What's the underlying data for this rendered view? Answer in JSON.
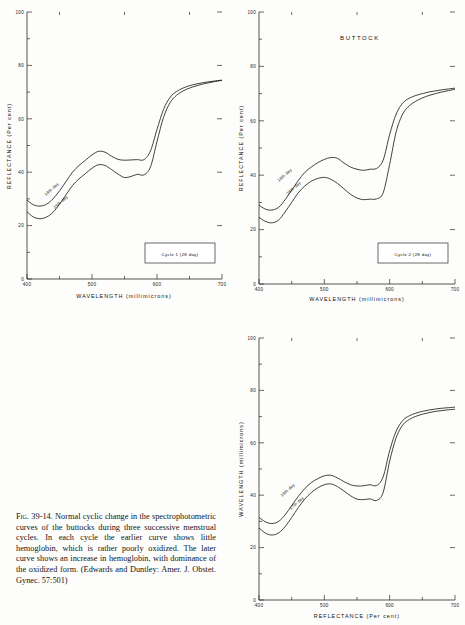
{
  "figure": {
    "caption_prefix": "Fig. 39-14.",
    "caption_body": "Normal cyclic change in the spectrophotometric curves of the buttocks during three successive menstrual cycles. In each cycle the earlier curve shows little hemoglobin, which is rather poorly oxidized. The later curve shows an increase in hemoglobin, with dominance of the oxidized form. (Edwards and Duntley: Amer. J. Obstet. Gynec. 57:501)"
  },
  "chart_data": [
    {
      "type": "line",
      "panel_id": "cycle-1",
      "title": "",
      "legend": "Cycle 1  (28 day)",
      "legend_position": "bottom-right",
      "xlabel": "WAVELENGTH  (millimicrons)",
      "ylabel": "REFLECTANCE  (Per cent)",
      "xlim": [
        400,
        700
      ],
      "ylim": [
        0,
        100
      ],
      "xticks": [
        400,
        500,
        600,
        700
      ],
      "xticklabels": [
        "400",
        "500",
        "600",
        "700"
      ],
      "yticks": [
        0,
        20,
        40,
        60,
        80,
        100
      ],
      "yticklabels": [
        "0",
        "20",
        "40",
        "60",
        "80",
        "100"
      ],
      "minor_xticks": [
        450,
        550,
        650
      ],
      "minor_yticks": [
        10,
        30,
        50,
        70,
        90
      ],
      "grid": false,
      "x": [
        400,
        410,
        420,
        430,
        440,
        450,
        460,
        470,
        480,
        490,
        500,
        510,
        520,
        530,
        540,
        550,
        560,
        570,
        580,
        590,
        600,
        610,
        620,
        630,
        640,
        650,
        660,
        670,
        680,
        690,
        700
      ],
      "series": [
        {
          "name": "18th day",
          "label": "18th day",
          "values": [
            29.5,
            27.8,
            27.3,
            28.0,
            30.0,
            33.0,
            36.5,
            40.0,
            42.5,
            44.5,
            46.5,
            47.8,
            47.5,
            46.0,
            44.8,
            44.5,
            44.6,
            44.7,
            44.7,
            48.0,
            56.0,
            63.5,
            68.0,
            70.2,
            71.5,
            72.4,
            73.0,
            73.5,
            73.9,
            74.2,
            74.5
          ]
        },
        {
          "name": "25th day",
          "label": "25th day",
          "values": [
            25.2,
            23.2,
            22.6,
            23.2,
            25.0,
            28.0,
            31.5,
            35.0,
            37.5,
            39.5,
            41.5,
            42.8,
            42.5,
            41.0,
            39.3,
            38.0,
            38.4,
            39.2,
            39.0,
            42.0,
            51.5,
            60.5,
            66.0,
            68.8,
            70.4,
            71.5,
            72.3,
            73.0,
            73.5,
            74.0,
            74.4
          ]
        }
      ]
    },
    {
      "type": "line",
      "panel_id": "cycle-2",
      "title": "BUTTOCK",
      "legend": "Cycle 2  (28 day)",
      "legend_position": "bottom-right",
      "xlabel": "WAVELENGTH  (millimicrons)",
      "ylabel": "REFLECTANCE  (Per cent)",
      "xlim": [
        400,
        700
      ],
      "ylim": [
        0,
        100
      ],
      "xticks": [
        400,
        500,
        600,
        700
      ],
      "xticklabels": [
        "400",
        "500",
        "600",
        "700"
      ],
      "yticks": [
        0,
        20,
        40,
        60,
        80,
        100
      ],
      "yticklabels": [
        "0",
        "20",
        "40",
        "60",
        "80",
        "100"
      ],
      "minor_xticks": [
        450,
        550,
        650
      ],
      "minor_yticks": [
        10,
        30,
        50,
        70,
        90
      ],
      "grid": false,
      "x": [
        400,
        410,
        420,
        430,
        440,
        450,
        460,
        470,
        480,
        490,
        500,
        510,
        520,
        530,
        540,
        550,
        560,
        570,
        580,
        590,
        600,
        610,
        620,
        630,
        640,
        650,
        660,
        670,
        680,
        690,
        700
      ],
      "series": [
        {
          "name": "18th day",
          "label": "18th day",
          "values": [
            29.0,
            27.5,
            27.2,
            28.2,
            31.0,
            34.5,
            38.0,
            41.0,
            43.0,
            44.6,
            45.8,
            46.5,
            46.2,
            44.5,
            43.0,
            42.2,
            41.8,
            42.2,
            42.5,
            45.5,
            55.0,
            62.5,
            66.5,
            68.3,
            69.3,
            70.0,
            70.6,
            71.0,
            71.4,
            71.7,
            72.0
          ]
        },
        {
          "name": "25th day",
          "label": "25th day",
          "values": [
            24.5,
            23.0,
            22.5,
            23.5,
            26.5,
            30.0,
            33.5,
            36.0,
            37.8,
            38.8,
            39.2,
            38.5,
            37.0,
            35.0,
            33.0,
            31.6,
            31.0,
            31.2,
            31.3,
            33.5,
            44.0,
            56.0,
            62.5,
            65.5,
            67.2,
            68.4,
            69.3,
            70.0,
            70.6,
            71.1,
            71.6
          ]
        }
      ]
    },
    {
      "type": "line",
      "panel_id": "cycle-3",
      "title": "",
      "legend": "Cycle 3  (28 day)",
      "legend_position": "bottom-right",
      "xlabel": "REFLECTANCE  (Per cent)",
      "ylabel": "WAVELENGTH  (millimicrons)",
      "xlim": [
        400,
        700
      ],
      "ylim": [
        0,
        100
      ],
      "xticks": [
        400,
        500,
        600,
        700
      ],
      "xticklabels": [
        "400",
        "500",
        "600",
        "700"
      ],
      "yticks": [
        0,
        20,
        40,
        60,
        80,
        100
      ],
      "yticklabels": [
        "0",
        "20",
        "40",
        "60",
        "80",
        "100"
      ],
      "minor_xticks": [
        450,
        550,
        650
      ],
      "minor_yticks": [
        10,
        30,
        50,
        70,
        90
      ],
      "grid": false,
      "x": [
        400,
        410,
        420,
        430,
        440,
        450,
        460,
        470,
        480,
        490,
        500,
        510,
        520,
        530,
        540,
        550,
        560,
        570,
        580,
        590,
        600,
        610,
        620,
        630,
        640,
        650,
        660,
        670,
        680,
        690,
        700
      ],
      "series": [
        {
          "name": "18th day",
          "label": "18th day",
          "values": [
            31.5,
            29.8,
            29.2,
            30.0,
            32.5,
            36.0,
            39.5,
            42.5,
            44.8,
            46.3,
            47.4,
            47.6,
            46.6,
            45.2,
            44.0,
            43.5,
            43.6,
            44.0,
            43.7,
            47.0,
            57.0,
            64.5,
            68.5,
            70.3,
            71.3,
            72.0,
            72.5,
            72.9,
            73.2,
            73.4,
            73.6
          ]
        },
        {
          "name": "17th day",
          "label": "17th day",
          "values": [
            27.5,
            25.5,
            24.8,
            25.6,
            28.0,
            31.5,
            35.2,
            38.5,
            41.0,
            42.8,
            44.0,
            44.3,
            43.3,
            41.6,
            39.8,
            38.5,
            38.3,
            38.6,
            38.0,
            41.0,
            53.0,
            62.0,
            66.8,
            68.9,
            70.1,
            70.9,
            71.5,
            72.0,
            72.3,
            72.6,
            72.8
          ]
        }
      ]
    }
  ]
}
